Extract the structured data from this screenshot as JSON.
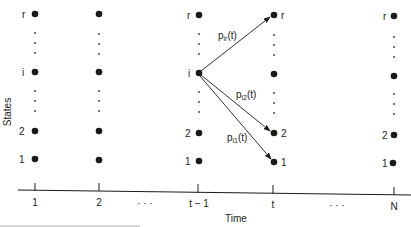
{
  "diagram": {
    "y_axis_label": "States",
    "x_axis_label": "Time",
    "state_labels": {
      "r": "r",
      "i": "i",
      "two": "2",
      "one": "1"
    },
    "time_labels": [
      "1",
      "2",
      "t − 1",
      "t",
      "N"
    ],
    "ellipsis": "·  ·  ·",
    "transitions": [
      {
        "from": "i (t-1)",
        "to": "r (t)",
        "label_main": "p",
        "label_sub": "ir",
        "label_tail": "(t)"
      },
      {
        "from": "i (t-1)",
        "to": "2 (t)",
        "label_main": "p",
        "label_sub": "i2",
        "label_tail": "(t)"
      },
      {
        "from": "i (t-1)",
        "to": "1 (t)",
        "label_main": "p",
        "label_sub": "i1",
        "label_tail": "(t)"
      }
    ],
    "colors": {
      "ink": "#1a1a1a",
      "background": "#ffffff"
    }
  }
}
